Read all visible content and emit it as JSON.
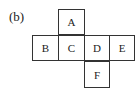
{
  "figure": {
    "label": "(b)",
    "cells": [
      {
        "letter": "A",
        "col": 1,
        "row": 0
      },
      {
        "letter": "B",
        "col": 0,
        "row": 1
      },
      {
        "letter": "C",
        "col": 1,
        "row": 1
      },
      {
        "letter": "D",
        "col": 2,
        "row": 1
      },
      {
        "letter": "E",
        "col": 3,
        "row": 1
      },
      {
        "letter": "F",
        "col": 2,
        "row": 2
      }
    ]
  }
}
